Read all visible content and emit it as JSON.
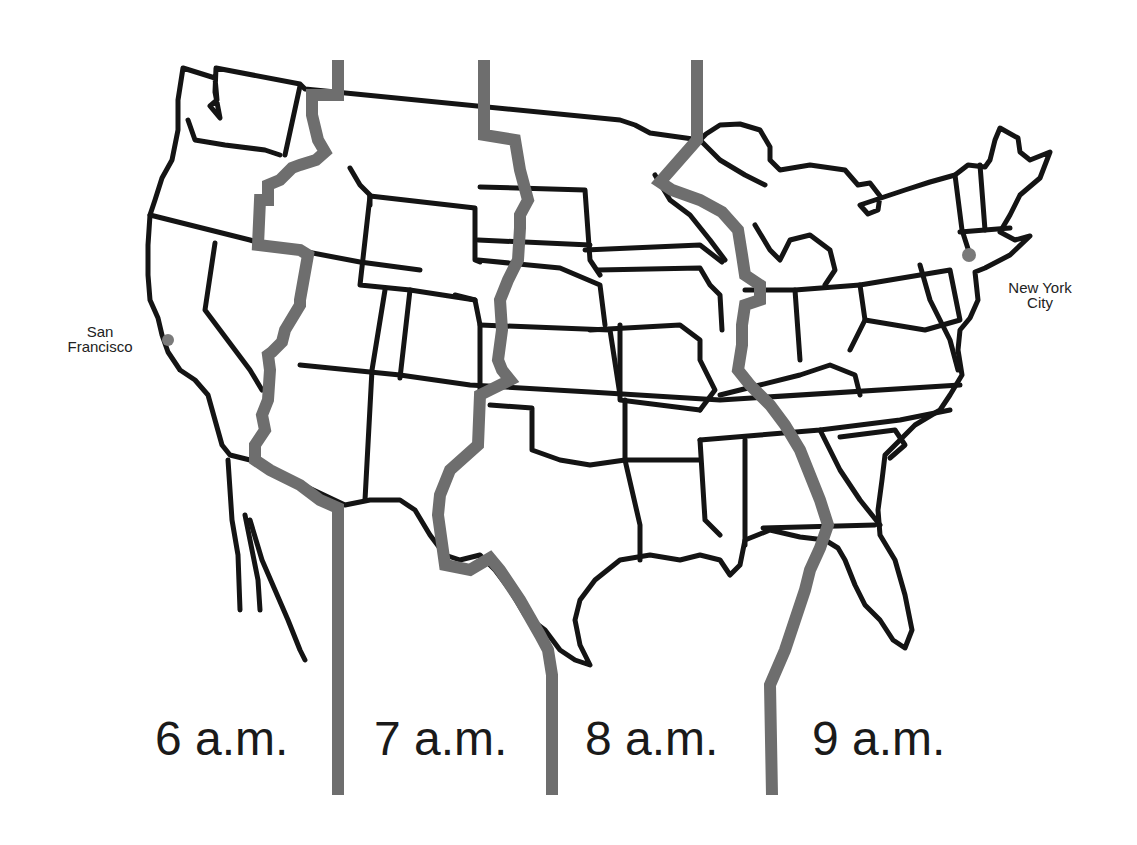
{
  "map": {
    "title": "U.S. Time Zones",
    "background_color": "#ffffff",
    "outline_color": "#141414",
    "timezone_line_color": "#6e6e6e",
    "city_dot_color": "#7a7a7a"
  },
  "cities": [
    {
      "name_line1": "San",
      "name_line2": "Francisco"
    },
    {
      "name_line1": "New York",
      "name_line2": "City"
    }
  ],
  "time_zones": [
    {
      "label": "6 a.m.",
      "zone": "Pacific"
    },
    {
      "label": "7 a.m.",
      "zone": "Mountain"
    },
    {
      "label": "8 a.m.",
      "zone": "Central"
    },
    {
      "label": "9 a.m.",
      "zone": "Eastern"
    }
  ]
}
